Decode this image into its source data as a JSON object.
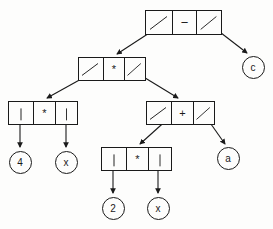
{
  "diagram": {
    "expression": "4 * x * (2 * x + a) - c",
    "type": "binary-expression-tree",
    "colors": {
      "stroke": "#1a1a1a",
      "background": "#fdfdfc",
      "text": "#1a1a1a"
    },
    "nodes": [
      {
        "id": "root",
        "kind": "operator",
        "operator": "−",
        "left_cell": "pointer",
        "right_cell": "pointer",
        "x": 145,
        "y": 10,
        "width": 77,
        "height": 25
      },
      {
        "id": "mul-top",
        "kind": "operator",
        "operator": "*",
        "left_cell": "pointer",
        "right_cell": "pointer",
        "x": 78,
        "y": 57,
        "width": 68,
        "height": 24
      },
      {
        "id": "mul-left",
        "kind": "operator",
        "operator": "*",
        "left_cell": "pointer",
        "right_cell": "pointer",
        "x": 8,
        "y": 101,
        "width": 70,
        "height": 24
      },
      {
        "id": "plus",
        "kind": "operator",
        "operator": "+",
        "left_cell": "pointer",
        "right_cell": "pointer",
        "x": 146,
        "y": 101,
        "width": 69,
        "height": 24
      },
      {
        "id": "mul-bottom",
        "kind": "operator",
        "operator": "*",
        "left_cell": "pointer",
        "right_cell": "pointer",
        "x": 101,
        "y": 147,
        "width": 71,
        "height": 24
      }
    ],
    "leaves": [
      {
        "id": "leaf-c",
        "label": "c",
        "cx": 253,
        "cy": 67
      },
      {
        "id": "leaf-4",
        "label": "4",
        "cx": 20,
        "cy": 162
      },
      {
        "id": "leaf-x1",
        "label": "x",
        "cx": 66,
        "cy": 162
      },
      {
        "id": "leaf-a",
        "label": "a",
        "cx": 228,
        "cy": 158
      },
      {
        "id": "leaf-2",
        "label": "2",
        "cx": 113,
        "cy": 208
      },
      {
        "id": "leaf-x2",
        "label": "x",
        "cx": 158,
        "cy": 208
      }
    ],
    "edges": [
      {
        "id": "edge-root-left",
        "from": "root",
        "from_side": "left",
        "to": "mul-top",
        "style": "diagonal"
      },
      {
        "id": "edge-root-right",
        "from": "root",
        "from_side": "right",
        "to": "leaf-c",
        "style": "diagonal"
      },
      {
        "id": "edge-multop-left",
        "from": "mul-top",
        "from_side": "left",
        "to": "mul-left",
        "style": "diagonal"
      },
      {
        "id": "edge-multop-right",
        "from": "mul-top",
        "from_side": "right",
        "to": "plus",
        "style": "diagonal"
      },
      {
        "id": "edge-mulleft-left",
        "from": "mul-left",
        "from_side": "left",
        "to": "leaf-4",
        "style": "vertical"
      },
      {
        "id": "edge-mulleft-right",
        "from": "mul-left",
        "from_side": "right",
        "to": "leaf-x1",
        "style": "vertical"
      },
      {
        "id": "edge-plus-left",
        "from": "plus",
        "from_side": "left",
        "to": "mul-bottom",
        "style": "diagonal"
      },
      {
        "id": "edge-plus-right",
        "from": "plus",
        "from_side": "right",
        "to": "leaf-a",
        "style": "diagonal"
      },
      {
        "id": "edge-mulbot-left",
        "from": "mul-bottom",
        "from_side": "left",
        "to": "leaf-2",
        "style": "vertical"
      },
      {
        "id": "edge-mulbot-right",
        "from": "mul-bottom",
        "from_side": "right",
        "to": "leaf-x2",
        "style": "vertical"
      }
    ]
  }
}
